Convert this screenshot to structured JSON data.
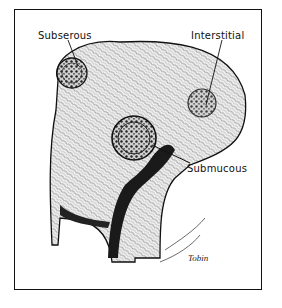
{
  "figure": {
    "labels": {
      "subserous": "Subserous",
      "interstitial": "Interstitial",
      "submucous": "Submucous"
    },
    "signature": "Tobin",
    "colors": {
      "ink": "#111111",
      "paper": "#ffffff",
      "tissue_fill": "#e8e8e8",
      "cavity": "#1a1a1a"
    }
  }
}
